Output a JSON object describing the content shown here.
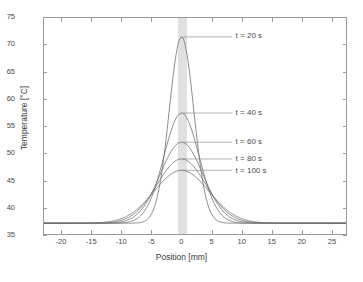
{
  "chart_data": {
    "type": "line",
    "title": "",
    "xlabel": "Position [mm]",
    "ylabel": "Temperature [°C]",
    "xlim": [
      -23,
      27.5
    ],
    "ylim": [
      35,
      75
    ],
    "xticks": [
      -20,
      -15,
      -10,
      -5,
      0,
      5,
      10,
      15,
      20,
      25
    ],
    "yticks": [
      35,
      40,
      45,
      50,
      55,
      60,
      65,
      70,
      75
    ],
    "xticklabels": [
      "-20",
      "-15",
      "-10",
      "-5",
      "0",
      "5",
      "10",
      "15",
      "20",
      "25"
    ],
    "yticklabels": [
      "35",
      "40",
      "45",
      "50",
      "55",
      "60",
      "65",
      "70",
      "75"
    ],
    "grid": false,
    "legend": "none",
    "baseline": 37,
    "shaded_band": {
      "x_start": -0.6,
      "x_end": 0.9,
      "color": "#e0e0e0",
      "label": "heat-source-region"
    },
    "series": [
      {
        "name": "t = 20 s",
        "peak_x": 0,
        "peak_y": 71.5,
        "sigma_mm": 2.05,
        "color": "#6f6f6f",
        "annotation": "t = 20 s",
        "leader_from_x": 0.2,
        "leader_from_y": 71.5,
        "label_x_mm": 8.5
      },
      {
        "name": "t = 40 s",
        "peak_x": 0,
        "peak_y": 57.4,
        "sigma_mm": 2.95,
        "color": "#6f6f6f",
        "annotation": "t = 40 s",
        "leader_from_x": 0.2,
        "leader_from_y": 57.4,
        "label_x_mm": 8.5
      },
      {
        "name": "t = 60 s",
        "peak_x": 0,
        "peak_y": 52.0,
        "sigma_mm": 3.55,
        "color": "#6f6f6f",
        "annotation": "t = 60 s",
        "leader_from_x": 0.2,
        "leader_from_y": 52.0,
        "label_x_mm": 8.5
      },
      {
        "name": "t = 80 s",
        "peak_x": 0,
        "peak_y": 48.9,
        "sigma_mm": 4.05,
        "color": "#6f6f6f",
        "annotation": "t = 80 s",
        "leader_from_x": 0.2,
        "leader_from_y": 48.9,
        "label_x_mm": 8.5
      },
      {
        "name": "t = 100 s",
        "peak_x": 0,
        "peak_y": 46.8,
        "sigma_mm": 4.55,
        "color": "#6f6f6f",
        "annotation": "t = 100 s",
        "leader_from_x": 0.2,
        "leader_from_y": 46.8,
        "label_x_mm": 8.5
      }
    ]
  },
  "axis": {
    "xlabel": "Position [mm]",
    "ylabel": "Temperature [°C]"
  },
  "annotations": {
    "t20": "t = 20 s",
    "t40": "t = 40 s",
    "t60": "t = 60 s",
    "t80": "t = 80 s",
    "t100": "t = 100 s"
  },
  "colors": {
    "curve": "#6f6f6f",
    "frame": "#9a9a9a",
    "band": "#e0e0e0",
    "text": "#3a3a3a"
  }
}
